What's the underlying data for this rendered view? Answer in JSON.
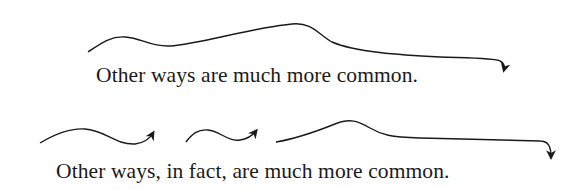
{
  "figure": {
    "example_1": {
      "sentence": "Other ways are much more common.",
      "arcs": 1
    },
    "example_2": {
      "sentence": "Other ways, in fact, are much more common.",
      "arcs": 3
    },
    "stroke_color": "#1a1a1a"
  }
}
